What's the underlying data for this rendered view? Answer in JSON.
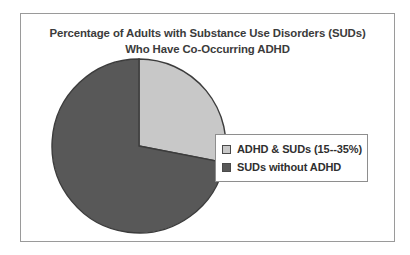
{
  "chart_data": {
    "type": "pie",
    "title": "Percentage of Adults with Substance Use Disorders (SUDs) Who Have Co-Occurring ADHD",
    "title_lines": [
      "Percentage of Adults with Substance Use Disorders (SUDs)",
      "Who Have Co-Occurring ADHD"
    ],
    "categories": [
      "ADHD & SUDs (15--35%)",
      "SUDs  without ADHD"
    ],
    "values": [
      28,
      72
    ],
    "start_angle_deg": 0,
    "direction": "clockwise",
    "legend_position": "right",
    "grid": false,
    "slices": [
      {
        "label": "ADHD & SUDs (15--35%)",
        "value": 28,
        "sweep_deg": 101,
        "color": "#c8c8c8",
        "stroke": "#3c3c3c"
      },
      {
        "label": "SUDs  without ADHD",
        "value": 72,
        "sweep_deg": 259,
        "color": "#585858",
        "stroke": "#3c3c3c"
      }
    ]
  },
  "legend": {
    "entries": [
      {
        "label": "ADHD & SUDs (15--35%)",
        "swatch_color": "#c8c8c8"
      },
      {
        "label": "SUDs  without ADHD",
        "swatch_color": "#585858"
      }
    ]
  },
  "colors": {
    "light_slice": "#c8c8c8",
    "dark_slice": "#585858",
    "slice_outline": "#3c3c3c",
    "frame_border": "#9a9a9a",
    "legend_border": "#8e8e8e",
    "title_text": "#3b3b3b",
    "legend_text": "#2f2f2f",
    "background": "#ffffff"
  }
}
